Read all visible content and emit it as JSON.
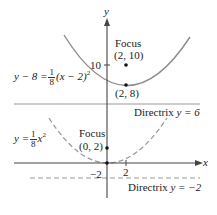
{
  "figure": {
    "axes": {
      "x_label": "x",
      "y_label": "y",
      "ticks": {
        "y_10": "10",
        "x_2": "2",
        "y_neg2": "−2"
      }
    },
    "upper_parabola": {
      "equation_lhs": "y − 8 =",
      "frac_num": "1",
      "frac_den": "8",
      "equation_rhs": "(x − 2)",
      "exponent": "2",
      "focus_label": "Focus",
      "focus_coords": "(2, 10)",
      "vertex_coords": "(2, 8)",
      "directrix_label": "Directrix",
      "directrix_eq": "y = 6",
      "style": "solid",
      "color": "#8c8c8c"
    },
    "lower_parabola": {
      "equation_lhs": "y =",
      "frac_num": "1",
      "frac_den": "8",
      "equation_rhs": "x",
      "exponent": "2",
      "focus_label": "Focus",
      "focus_coords": "(0, 2)",
      "directrix_label": "Directrix",
      "directrix_eq": "y = −2",
      "style": "dashed",
      "color": "#9a9a9a"
    },
    "colors": {
      "axis": "#444444",
      "curve": "#8c8c8c",
      "point": "#111111",
      "directrix": "#999999"
    }
  }
}
